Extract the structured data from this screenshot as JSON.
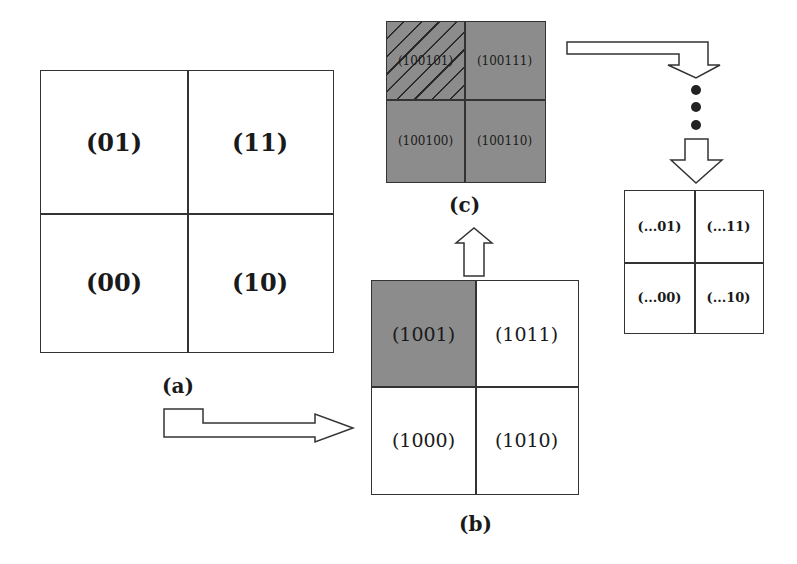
{
  "grid_a": {
    "caption": "(a)",
    "cells": {
      "top_left": "(01)",
      "top_right": "(11)",
      "bottom_left": "(00)",
      "bottom_right": "(10)"
    }
  },
  "grid_b": {
    "caption": "(b)",
    "highlighted_cell": "top_left",
    "cells": {
      "top_left": "(1001)",
      "top_right": "(1011)",
      "bottom_left": "(1000)",
      "bottom_right": "(1010)"
    }
  },
  "grid_c": {
    "caption": "(c)",
    "hatched_cell": "top_left",
    "cells": {
      "top_left": "(100101)",
      "top_right": "(100111)",
      "bottom_left": "(100100)",
      "bottom_right": "(100110)"
    }
  },
  "grid_final": {
    "cells": {
      "top_left": "(...01)",
      "top_right": "(...11)",
      "bottom_left": "(...00)",
      "bottom_right": "(...10)"
    }
  },
  "colors": {
    "gray_fill": "#8c8c8c",
    "line": "#333333",
    "background": "#ffffff"
  }
}
